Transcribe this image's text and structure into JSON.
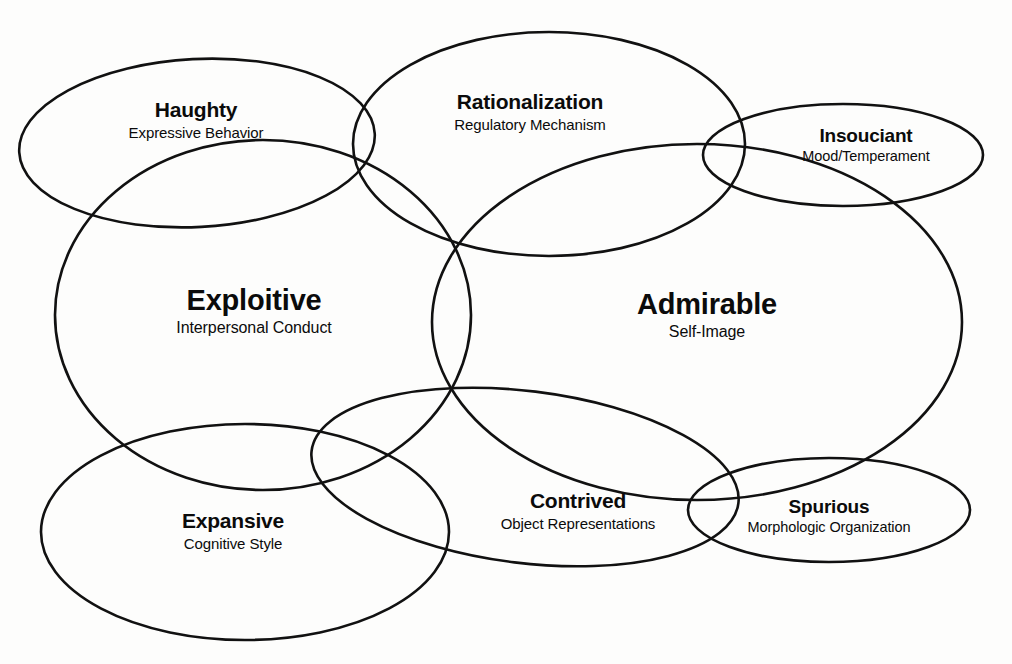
{
  "diagram": {
    "type": "venn-overlapping-ellipses",
    "background_color": "#fdfdfc",
    "stroke_color": "#111111",
    "text_color": "#0b0b0b",
    "domains": [
      {
        "key": "haughty",
        "title": "Haughty",
        "subtitle": "Expressive Behavior",
        "label_x": 196,
        "label_y": 120,
        "size": "sz-md",
        "ellipse": {
          "cx": 197,
          "cy": 143,
          "rx": 178,
          "ry": 84,
          "rotate": -3
        }
      },
      {
        "key": "rationalization",
        "title": "Rationalization",
        "subtitle": "Regulatory Mechanism",
        "label_x": 530,
        "label_y": 112,
        "size": "sz-md",
        "ellipse": {
          "cx": 549,
          "cy": 144,
          "rx": 196,
          "ry": 112,
          "rotate": 0
        }
      },
      {
        "key": "insouciant",
        "title": "Insouciant",
        "subtitle": "Mood/Temperament",
        "label_x": 866,
        "label_y": 145,
        "size": "sz-sm",
        "ellipse": {
          "cx": 843,
          "cy": 155,
          "rx": 140,
          "ry": 51,
          "rotate": 0
        }
      },
      {
        "key": "exploitive",
        "title": "Exploitive",
        "subtitle": "Interpersonal Conduct",
        "label_x": 254,
        "label_y": 311,
        "size": "sz-lg",
        "ellipse": {
          "cx": 263,
          "cy": 315,
          "rx": 208,
          "ry": 175,
          "rotate": 0
        }
      },
      {
        "key": "admirable",
        "title": "Admirable",
        "subtitle": "Self-Image",
        "label_x": 707,
        "label_y": 315,
        "size": "sz-lg",
        "ellipse": {
          "cx": 697,
          "cy": 322,
          "rx": 265,
          "ry": 178,
          "rotate": 0
        }
      },
      {
        "key": "expansive",
        "title": "Expansive",
        "subtitle": "Cognitive Style",
        "label_x": 233,
        "label_y": 531,
        "size": "sz-md",
        "ellipse": {
          "cx": 245,
          "cy": 532,
          "rx": 204,
          "ry": 108,
          "rotate": 0
        }
      },
      {
        "key": "contrived",
        "title": "Contrived",
        "subtitle": "Object Representations",
        "label_x": 578,
        "label_y": 511,
        "size": "sz-md",
        "ellipse": {
          "cx": 525,
          "cy": 477,
          "rx": 215,
          "ry": 86,
          "rotate": 7
        }
      },
      {
        "key": "spurious",
        "title": "Spurious",
        "subtitle": "Morphologic Organization",
        "label_x": 829,
        "label_y": 516,
        "size": "sz-sm",
        "ellipse": {
          "cx": 829,
          "cy": 510,
          "rx": 141,
          "ry": 52,
          "rotate": 0
        }
      }
    ]
  }
}
